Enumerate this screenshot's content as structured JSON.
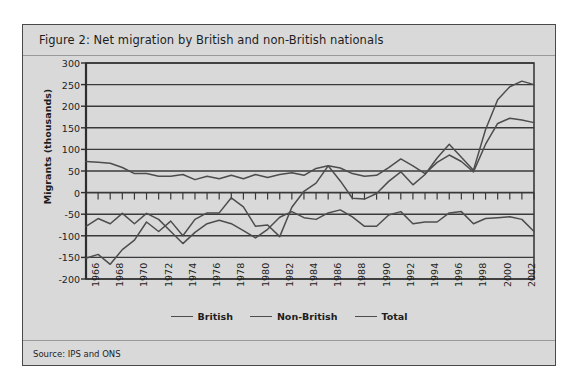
{
  "figure": {
    "title": "Figure 2: Net migration by British and non-British nationals",
    "source": "Source: IPS and ONS"
  },
  "chart_data": {
    "type": "line",
    "title": "Figure 2: Net migration by British and non-British nationals",
    "xlabel": "",
    "ylabel": "Migrants (thousands)",
    "ylim": [
      -200,
      300
    ],
    "ytick_step": 50,
    "yticks": [
      300,
      250,
      200,
      150,
      100,
      50,
      0,
      -50,
      -100,
      -150,
      -200
    ],
    "ytick_labels": [
      "300",
      "250",
      "200",
      "150",
      "100",
      "50",
      "0",
      "-50",
      "-100",
      "-150",
      "-200"
    ],
    "xlim": [
      1966,
      2003
    ],
    "x": [
      1966,
      1967,
      1968,
      1969,
      1970,
      1971,
      1972,
      1973,
      1974,
      1975,
      1976,
      1977,
      1978,
      1979,
      1980,
      1981,
      1982,
      1983,
      1984,
      1985,
      1986,
      1987,
      1988,
      1989,
      1990,
      1991,
      1992,
      1993,
      1994,
      1995,
      1996,
      1997,
      1998,
      1999,
      2000,
      2001,
      2002,
      2003
    ],
    "xtick_labels": [
      "1966",
      "1968",
      "1970",
      "1972",
      "1974",
      "1976",
      "1978",
      "1980",
      "1982",
      "1984",
      "1986",
      "1988",
      "1990",
      "1992",
      "1994",
      "1996",
      "1998",
      "2000",
      "2002"
    ],
    "xtick_values": [
      1966,
      1968,
      1970,
      1972,
      1974,
      1976,
      1978,
      1980,
      1982,
      1984,
      1986,
      1988,
      1990,
      1992,
      1994,
      1996,
      1998,
      2000,
      2002
    ],
    "grid": true,
    "grid_axis": "y",
    "legend_position": "bottom",
    "line_color": "#4d4d4d",
    "series": [
      {
        "name": "British",
        "values": [
          -78,
          -60,
          -72,
          -48,
          -72,
          -48,
          -62,
          -90,
          -118,
          -92,
          -72,
          -64,
          -72,
          -88,
          -105,
          -85,
          -57,
          -44,
          -58,
          -62,
          -47,
          -40,
          -56,
          -78,
          -78,
          -52,
          -44,
          -72,
          -68,
          -68,
          -47,
          -44,
          -72,
          -60,
          -58,
          -56,
          -62,
          -90
        ]
      },
      {
        "name": "Non-British",
        "values": [
          72,
          70,
          68,
          58,
          44,
          44,
          38,
          38,
          42,
          30,
          38,
          32,
          40,
          32,
          42,
          35,
          42,
          46,
          40,
          56,
          62,
          57,
          44,
          38,
          40,
          58,
          78,
          62,
          44,
          70,
          87,
          72,
          48,
          112,
          160,
          172,
          168,
          162
        ]
      },
      {
        "name": "Total",
        "values": [
          -152,
          -143,
          -166,
          -132,
          -110,
          -68,
          -90,
          -66,
          -100,
          -62,
          -47,
          -47,
          -12,
          -33,
          -78,
          -75,
          -102,
          -34,
          3,
          22,
          62,
          27,
          -13,
          -15,
          -2,
          26,
          48,
          18,
          42,
          80,
          112,
          82,
          52,
          146,
          215,
          245,
          258,
          250
        ]
      }
    ]
  }
}
